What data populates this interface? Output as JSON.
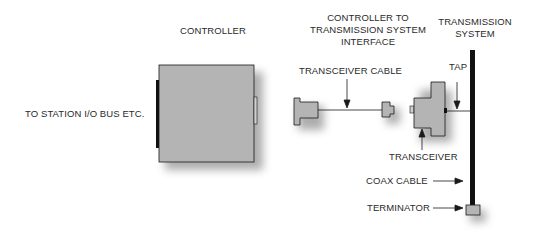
{
  "diagram": {
    "labels": {
      "controller": "CONTROLLER",
      "station_bus": "TO STATION I/O BUS ETC.",
      "interface_line1": "CONTROLLER TO",
      "interface_line2": "TRANSMISSION SYSTEM",
      "interface_line3": "INTERFACE",
      "transmission_line1": "TRANSMISSION",
      "transmission_line2": "SYSTEM",
      "transceiver_cable": "TRANSCEIVER CABLE",
      "tap": "TAP",
      "transceiver": "TRANSCEIVER",
      "coax_cable": "COAX CABLE",
      "terminator": "TERMINATOR"
    },
    "colors": {
      "component_fill": "#b4b4b4",
      "outline": "#1a1a1a",
      "shadow": "#9a9a9a",
      "text": "#2a2a2a"
    }
  }
}
